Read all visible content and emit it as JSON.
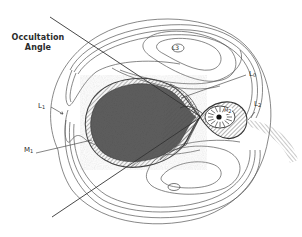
{
  "diagram": {
    "labels": {
      "occultation_line1": "Occultation",
      "occultation_line2": "Angle",
      "L1": "L",
      "L1_sub": "1",
      "M1": "M",
      "M1_sub": "1",
      "L0": "L",
      "L0_sub": "0",
      "L2": "L",
      "L2_sub": "2",
      "L3": "L3",
      "M2": "M",
      "M2_sub": "2"
    },
    "colors": {
      "primary_fill": "#5e5e5e",
      "line": "#444444",
      "hatch": "#666666",
      "background": "#ffffff"
    }
  }
}
